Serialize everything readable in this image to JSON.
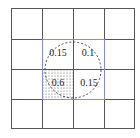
{
  "grid": {
    "rows": 4,
    "cols": 4,
    "line_color": "#555555",
    "highlight_color": "#8a8ad0"
  },
  "cells": [
    {
      "row": 1,
      "col": 1,
      "value": "0.15"
    },
    {
      "row": 1,
      "col": 2,
      "value": "0.1"
    },
    {
      "row": 2,
      "col": 1,
      "value": "0.6",
      "shaded": true
    },
    {
      "row": 2,
      "col": 2,
      "value": "0.15"
    }
  ],
  "labels": {
    "c11": "0.15",
    "c12": "0.1",
    "c21": "0.6",
    "c22": "0.15"
  },
  "circle": {
    "style": "dashed",
    "color": "#333333"
  }
}
